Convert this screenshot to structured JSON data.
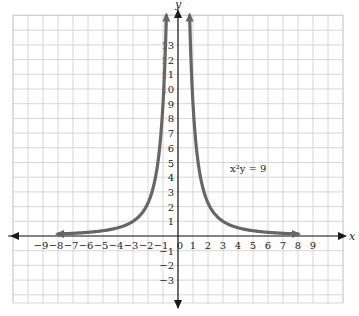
{
  "chart_data": {
    "type": "line",
    "title": "",
    "equation_label": "x²y = 9",
    "equation": "y = 9 / x^2",
    "xlabel": "x",
    "ylabel": "y",
    "xlim": [
      -11,
      11
    ],
    "ylim": [
      -4.5,
      15
    ],
    "grid": true,
    "x_ticks": [
      -9,
      -8,
      -7,
      -6,
      -5,
      -4,
      -3,
      -2,
      -1,
      0,
      1,
      2,
      3,
      4,
      5,
      6,
      7,
      8,
      9
    ],
    "y_ticks": [
      -3,
      -2,
      -1,
      1,
      2,
      3,
      4,
      5,
      6,
      7,
      8,
      9,
      10,
      11,
      12,
      13
    ],
    "series": [
      {
        "name": "x²y = 9 (left branch)",
        "x": [
          -8,
          -7,
          -6,
          -5,
          -4,
          -3,
          -2,
          -1.5,
          -1,
          -0.9,
          -0.8
        ],
        "y": [
          0.14,
          0.18,
          0.25,
          0.36,
          0.56,
          1,
          2.25,
          4,
          9,
          11.1,
          14.1
        ]
      },
      {
        "name": "x²y = 9 (right branch)",
        "x": [
          0.8,
          0.9,
          1,
          1.5,
          2,
          3,
          4,
          5,
          6,
          7,
          8
        ],
        "y": [
          14.1,
          11.1,
          9,
          4,
          2.25,
          1,
          0.56,
          0.36,
          0.25,
          0.18,
          0.14
        ]
      }
    ],
    "colors": {
      "curve": "#666666",
      "axis": "#1a1a1a",
      "grid": "#cccccc"
    }
  }
}
